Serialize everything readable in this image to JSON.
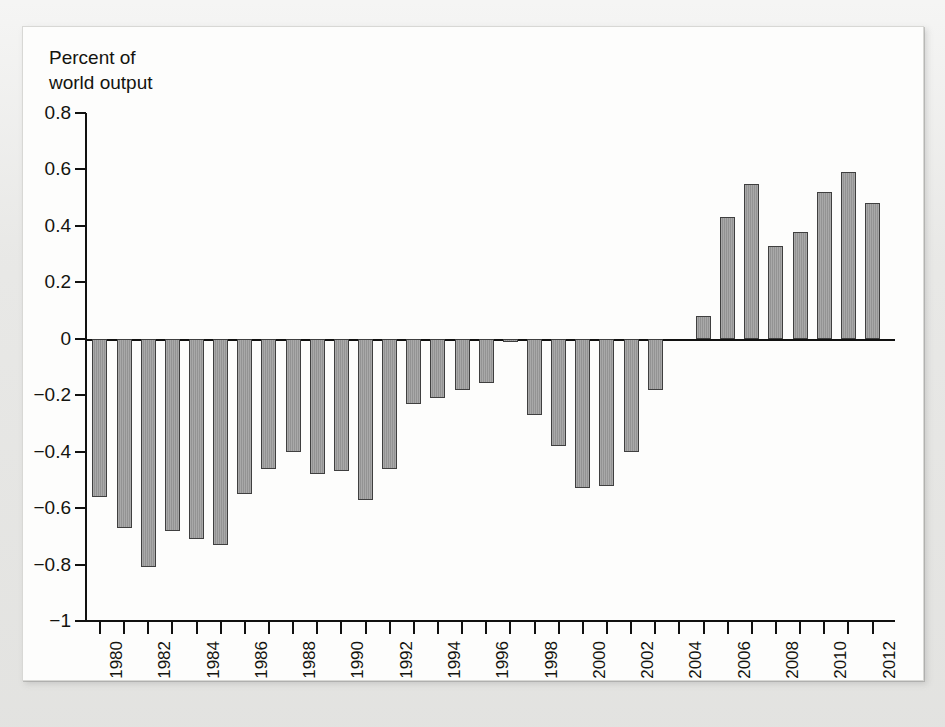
{
  "figure": {
    "y_axis_title": "Percent of\nworld output",
    "bar_fill_color": "#9b9b9b",
    "bar_stroke_color": "#3f3f3f",
    "axis_color": "#111110",
    "panel_background": "#fdfdfc",
    "page_background": "#e9e9e7"
  },
  "ghost_text": {
    "note": "faint bleed-through text from the reverse page, not part of the chart",
    "lines": [
      {
        "x": 150,
        "y": 46,
        "text": "a market where the different interpretations of informa"
      },
      {
        "x": 150,
        "y": 72,
        "text": "Within the context of implementing a country's macroeco"
      },
      {
        "x": 118,
        "y": 98,
        "text": "the challenges of maintaining strong financial ties with its trading"
      },
      {
        "x": 128,
        "y": 124,
        "text": "only possible with monetary and fiscal adjustments geared to the"
      },
      {
        "x": 150,
        "y": 150,
        "text": "exchange rate. Whatever the interpretation of the shift in the"
      },
      {
        "x": 180,
        "y": 176,
        "text": "level of economic activity are not fully compatible with changes in"
      },
      {
        "x": 330,
        "y": 202,
        "text": "the balance of payments."
      },
      {
        "x": 78,
        "y": 262,
        "text": "A bit disappointing, the export of imported workers came"
      },
      {
        "x": 66,
        "y": 300,
        "text": "American Economic Review of manufactured"
      },
      {
        "x": 66,
        "y": 326,
        "text": "their earnings continued to the value of"
      },
      {
        "x": 60,
        "y": 352,
        "text": "2. Insurance and the exchange rate, the"
      },
      {
        "x": 110,
        "y": 378,
        "text": "which was also reviewed by the"
      },
      {
        "x": 90,
        "y": 404,
        "text": "countries and the issue of surplus and"
      },
      {
        "x": 120,
        "y": 430,
        "text": "national issue. Of course, a country's terms of"
      },
      {
        "x": 100,
        "y": 456,
        "text": "3. Such a current account position of three monetary"
      }
    ]
  },
  "chart_data": {
    "type": "bar",
    "title": "",
    "subtitle": "",
    "xlabel": "",
    "ylabel": "Percent of world output",
    "ylim": [
      -1,
      0.8
    ],
    "ytick_values": [
      0.8,
      0.6,
      0.4,
      0.2,
      0,
      -0.2,
      -0.4,
      -0.6,
      -0.8,
      -1
    ],
    "ytick_labels": [
      "0.8",
      "0.6",
      "0.4",
      "0.2",
      "0",
      "−0.2",
      "−0.4",
      "−0.6",
      "−0.8",
      "−1"
    ],
    "grid": false,
    "legend": false,
    "xtick_label_rotation": -90,
    "xtick_label_interval": 2,
    "categories": [
      "1980",
      "1981",
      "1982",
      "1983",
      "1984",
      "1985",
      "1986",
      "1987",
      "1988",
      "1989",
      "1990",
      "1991",
      "1992",
      "1993",
      "1994",
      "1995",
      "1996",
      "1997",
      "1998",
      "1999",
      "2000",
      "2001",
      "2002",
      "2003",
      "2004",
      "2005",
      "2006",
      "2007",
      "2008",
      "2009",
      "2010",
      "2011",
      "2012"
    ],
    "xtick_labels_shown": [
      "1980",
      "1982",
      "1984",
      "1986",
      "1988",
      "1990",
      "1992",
      "1994",
      "1996",
      "1998",
      "2000",
      "2002",
      "2004",
      "2006",
      "2008",
      "2010",
      "2012"
    ],
    "values": [
      -0.56,
      -0.67,
      -0.81,
      -0.68,
      -0.71,
      -0.73,
      -0.55,
      -0.46,
      -0.4,
      -0.48,
      -0.47,
      -0.57,
      -0.46,
      -0.23,
      -0.21,
      -0.18,
      -0.155,
      -0.01,
      -0.27,
      -0.38,
      -0.53,
      -0.52,
      -0.4,
      -0.18,
      0.0,
      0.08,
      0.43,
      0.55,
      0.33,
      0.38,
      0.52,
      0.59,
      0.48
    ]
  }
}
